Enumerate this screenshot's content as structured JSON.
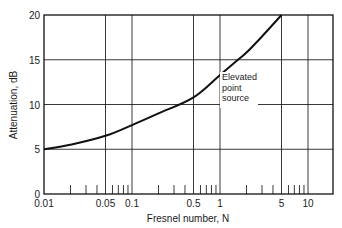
{
  "chart_data": {
    "type": "line",
    "title": "",
    "xlabel": "Fresnel number, N",
    "ylabel": "Attenuation, dB",
    "xscale": "log",
    "xlim": [
      0.01,
      19
    ],
    "ylim": [
      0,
      20
    ],
    "grid": true,
    "x_tick_labels": [
      "0.01",
      "0.05",
      "0.1",
      "0.5",
      "1",
      "5",
      "10"
    ],
    "x_tick_values": [
      0.01,
      0.05,
      0.1,
      0.5,
      1,
      5,
      10
    ],
    "y_tick_labels": [
      "0",
      "5",
      "10",
      "15",
      "20"
    ],
    "y_tick_values": [
      0,
      5,
      10,
      15,
      20
    ],
    "x_gridlines": [
      0.05,
      0.1,
      0.5,
      1,
      5,
      10
    ],
    "y_gridlines": [
      5,
      10,
      15
    ],
    "minor_ticks": [
      0.02,
      0.03,
      0.04,
      0.06,
      0.07,
      0.08,
      0.09,
      0.2,
      0.3,
      0.4,
      0.6,
      0.7,
      0.8,
      0.9,
      2,
      3,
      4,
      6,
      7,
      8,
      9
    ],
    "series": [
      {
        "name": "Elevated point source",
        "x": [
          0.01,
          0.02,
          0.05,
          0.1,
          0.2,
          0.5,
          1,
          1.6,
          2,
          3,
          5
        ],
        "y": [
          5.0,
          5.5,
          6.5,
          7.7,
          9.0,
          10.8,
          13.3,
          15.0,
          15.8,
          17.6,
          20.0
        ]
      }
    ],
    "annotations": [
      {
        "text": [
          "Elevated",
          "point",
          "source"
        ],
        "x": 1.05,
        "y": 10
      }
    ],
    "legend": null
  }
}
